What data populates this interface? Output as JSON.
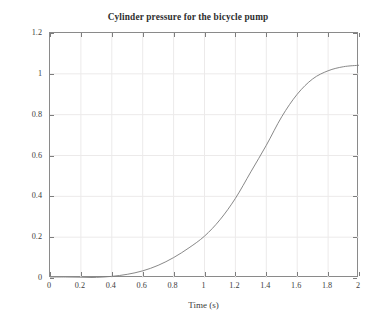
{
  "chart_data": {
    "type": "line",
    "title": "Cylinder pressure for the bicycle pump",
    "xlabel": "Time (s)",
    "ylabel": "Gauge pressure (MPa)",
    "xlim": [
      0,
      2
    ],
    "ylim": [
      0,
      1.2
    ],
    "xticks": [
      "0",
      "0.2",
      "0.4",
      "0.6",
      "0.8",
      "1",
      "1.2",
      "1.4",
      "1.6",
      "1.8",
      "2"
    ],
    "xtick_values": [
      0,
      0.2,
      0.4,
      0.6,
      0.8,
      1.0,
      1.2,
      1.4,
      1.6,
      1.8,
      2.0
    ],
    "yticks": [
      "0",
      "0.2",
      "0.4",
      "0.6",
      "0.8",
      "1",
      "1.2"
    ],
    "ytick_values": [
      0,
      0.2,
      0.4,
      0.6,
      0.8,
      1.0,
      1.2
    ],
    "grid": true,
    "grid_color": "#eceaea",
    "legend": null,
    "line_color": "#7b7b7b",
    "line_width": 0.9,
    "series": [
      {
        "name": "Gauge pressure",
        "x": [
          0.0,
          0.1,
          0.2,
          0.3,
          0.4,
          0.5,
          0.6,
          0.7,
          0.8,
          0.9,
          1.0,
          1.1,
          1.2,
          1.3,
          1.4,
          1.5,
          1.6,
          1.7,
          1.8,
          1.9,
          2.0
        ],
        "y": [
          0.0,
          0.0,
          0.001,
          0.003,
          0.008,
          0.018,
          0.035,
          0.062,
          0.1,
          0.148,
          0.205,
          0.285,
          0.39,
          0.52,
          0.65,
          0.79,
          0.9,
          0.975,
          1.015,
          1.035,
          1.042
        ]
      }
    ]
  }
}
